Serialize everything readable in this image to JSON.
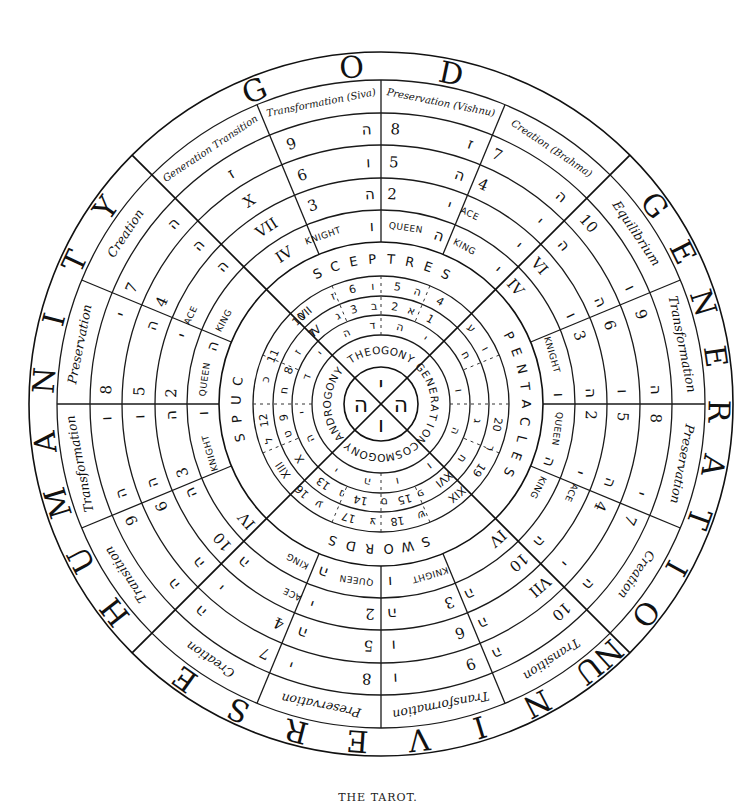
{
  "caption": "THE TAROT.",
  "geometry": {
    "cx": 381,
    "cy": 404,
    "rings": [
      352,
      324,
      291,
      259,
      226,
      194,
      162,
      128,
      108,
      89,
      69,
      37
    ],
    "heavy_rings": [
      352,
      162,
      37
    ]
  },
  "outer_words": [
    {
      "word": "GOD",
      "start": -22,
      "step": 17
    },
    {
      "word": "GENERATION",
      "start": 54,
      "step": 9.3
    },
    {
      "word": "UNIVERSE",
      "start": 142,
      "step": 10.5
    },
    {
      "word": "HUMANITY",
      "start": 232,
      "step": 10.5
    }
  ],
  "sector_labels": [
    {
      "text": "Generation Transition",
      "angle": -33.75,
      "cls": "t-label-sm"
    },
    {
      "text": "Transformation (Siva)",
      "angle": -11.25,
      "cls": "t-label-sm"
    },
    {
      "text": "Preservation (Vishnu)",
      "angle": 11.25,
      "cls": "t-label-sm"
    },
    {
      "text": "Creation (Brahma)",
      "angle": 33.75,
      "cls": "t-label-sm"
    },
    {
      "text": "Equilibrium",
      "angle": 56.25,
      "cls": "t-label"
    },
    {
      "text": "Transformation",
      "angle": 78.75,
      "cls": "t-label"
    },
    {
      "text": "Preservation",
      "angle": 101.25,
      "cls": "t-label"
    },
    {
      "text": "Creation",
      "angle": 123.75,
      "cls": "t-label"
    },
    {
      "text": "Transition",
      "angle": 146.25,
      "cls": "t-label"
    },
    {
      "text": "Transformation",
      "angle": 168.75,
      "cls": "t-label"
    },
    {
      "text": "Preservation",
      "angle": 191.25,
      "cls": "t-label"
    },
    {
      "text": "Creation",
      "angle": 213.75,
      "cls": "t-label"
    },
    {
      "text": "Transition",
      "angle": 236.25,
      "cls": "t-label"
    },
    {
      "text": "Transformation",
      "angle": 258.75,
      "cls": "t-label"
    },
    {
      "text": "Preservation",
      "angle": 281.25,
      "cls": "t-label"
    },
    {
      "text": "Creation",
      "angle": 303.75,
      "cls": "t-label"
    }
  ],
  "ring_cells": [
    {
      "r": 275,
      "items": [
        {
          "a": -33,
          "t": "ז",
          "c": "t-heb"
        },
        {
          "a": -19,
          "t": "9",
          "c": "t-num"
        },
        {
          "a": -3,
          "t": "ה",
          "c": "t-heb"
        },
        {
          "a": 3,
          "t": "8",
          "c": "t-num"
        },
        {
          "a": 19,
          "t": "ז",
          "c": "t-heb"
        },
        {
          "a": 25,
          "t": "7",
          "c": "t-num"
        },
        {
          "a": 41,
          "t": "ה",
          "c": "t-heb"
        },
        {
          "a": 49,
          "t": "10",
          "c": "t-num"
        },
        {
          "a": 65,
          "t": "ו",
          "c": "t-heb"
        },
        {
          "a": 71,
          "t": "9",
          "c": "t-num"
        },
        {
          "a": 87,
          "t": "ה",
          "c": "t-heb"
        },
        {
          "a": 93,
          "t": "8",
          "c": "t-num"
        },
        {
          "a": 109,
          "t": "י",
          "c": "t-heb"
        },
        {
          "a": 115,
          "t": "7",
          "c": "t-num"
        },
        {
          "a": 131,
          "t": "ה",
          "c": "t-heb"
        },
        {
          "a": 139,
          "t": "10",
          "c": "t-num"
        },
        {
          "a": 155,
          "t": "ה",
          "c": "t-heb"
        },
        {
          "a": 161,
          "t": "9",
          "c": "t-num"
        },
        {
          "a": 177,
          "t": "ו",
          "c": "t-heb"
        },
        {
          "a": 183,
          "t": "8",
          "c": "t-num"
        },
        {
          "a": 199,
          "t": "י",
          "c": "t-heb"
        },
        {
          "a": 205,
          "t": "7",
          "c": "t-num"
        },
        {
          "a": 221,
          "t": "ה",
          "c": "t-heb"
        },
        {
          "a": 229,
          "t": "ה",
          "c": "t-heb"
        },
        {
          "a": 245,
          "t": "9",
          "c": "t-num"
        },
        {
          "a": 251,
          "t": "ה",
          "c": "t-heb"
        },
        {
          "a": 267,
          "t": "ו",
          "c": "t-heb"
        },
        {
          "a": 273,
          "t": "8",
          "c": "t-num"
        },
        {
          "a": 289,
          "t": "י",
          "c": "t-heb"
        },
        {
          "a": 295,
          "t": "7",
          "c": "t-num"
        },
        {
          "a": 311,
          "t": "ה",
          "c": "t-heb"
        }
      ]
    },
    {
      "r": 242,
      "items": [
        {
          "a": -33,
          "t": "X",
          "c": "t-num"
        },
        {
          "a": -19,
          "t": "6",
          "c": "t-num"
        },
        {
          "a": -3,
          "t": "ו",
          "c": "t-heb"
        },
        {
          "a": 3,
          "t": "5",
          "c": "t-num"
        },
        {
          "a": 19,
          "t": "ה",
          "c": "t-heb"
        },
        {
          "a": 25,
          "t": "4",
          "c": "t-num"
        },
        {
          "a": 41,
          "t": "י",
          "c": "t-heb"
        },
        {
          "a": 49,
          "t": "ה",
          "c": "t-heb"
        },
        {
          "a": 65,
          "t": "ה",
          "c": "t-heb"
        },
        {
          "a": 71,
          "t": "6",
          "c": "t-num"
        },
        {
          "a": 87,
          "t": "ו",
          "c": "t-heb"
        },
        {
          "a": 93,
          "t": "5",
          "c": "t-num"
        },
        {
          "a": 109,
          "t": "ה",
          "c": "t-heb"
        },
        {
          "a": 115,
          "t": "4",
          "c": "t-num"
        },
        {
          "a": 131,
          "t": "י",
          "c": "t-heb"
        },
        {
          "a": 139,
          "t": "VII",
          "c": "t-num"
        },
        {
          "a": 155,
          "t": "ה",
          "c": "t-heb"
        },
        {
          "a": 161,
          "t": "6",
          "c": "t-num"
        },
        {
          "a": 177,
          "t": "ו",
          "c": "t-heb"
        },
        {
          "a": 183,
          "t": "5",
          "c": "t-num"
        },
        {
          "a": 199,
          "t": "ה",
          "c": "t-heb"
        },
        {
          "a": 205,
          "t": "4",
          "c": "t-num"
        },
        {
          "a": 221,
          "t": "י",
          "c": "t-heb"
        },
        {
          "a": 229,
          "t": "ה",
          "c": "t-heb"
        },
        {
          "a": 245,
          "t": "6",
          "c": "t-num"
        },
        {
          "a": 251,
          "t": "ה",
          "c": "t-heb"
        },
        {
          "a": 267,
          "t": "ו",
          "c": "t-heb"
        },
        {
          "a": 273,
          "t": "5",
          "c": "t-num"
        },
        {
          "a": 289,
          "t": "ה",
          "c": "t-heb"
        },
        {
          "a": 295,
          "t": "4",
          "c": "t-num"
        },
        {
          "a": 311,
          "t": "ה",
          "c": "t-heb"
        }
      ]
    },
    {
      "r": 210,
      "items": [
        {
          "a": -33,
          "t": "VII",
          "c": "t-num"
        },
        {
          "a": -19,
          "t": "3",
          "c": "t-num"
        },
        {
          "a": -3,
          "t": "ה",
          "c": "t-heb"
        },
        {
          "a": 3,
          "t": "2",
          "c": "t-num"
        },
        {
          "a": 19,
          "t": "י",
          "c": "t-heb"
        },
        {
          "a": 25,
          "t": "ACE",
          "c": "t-court"
        },
        {
          "a": 41,
          "t": "י",
          "c": "t-heb"
        },
        {
          "a": 49,
          "t": "VI",
          "c": "t-num"
        },
        {
          "a": 65,
          "t": "ו",
          "c": "t-heb"
        },
        {
          "a": 71,
          "t": "3",
          "c": "t-num"
        },
        {
          "a": 87,
          "t": "ה",
          "c": "t-heb"
        },
        {
          "a": 93,
          "t": "2",
          "c": "t-num"
        },
        {
          "a": 109,
          "t": "י",
          "c": "t-heb"
        },
        {
          "a": 115,
          "t": "ACE",
          "c": "t-court"
        },
        {
          "a": 131,
          "t": "ה",
          "c": "t-heb"
        },
        {
          "a": 139,
          "t": "10",
          "c": "t-num"
        },
        {
          "a": 155,
          "t": "ה",
          "c": "t-heb"
        },
        {
          "a": 161,
          "t": "3",
          "c": "t-num"
        },
        {
          "a": 177,
          "t": "ה",
          "c": "t-heb"
        },
        {
          "a": 183,
          "t": "2",
          "c": "t-num"
        },
        {
          "a": 199,
          "t": "י",
          "c": "t-heb"
        },
        {
          "a": 205,
          "t": "ACE",
          "c": "t-court"
        },
        {
          "a": 221,
          "t": "ה",
          "c": "t-heb"
        },
        {
          "a": 229,
          "t": "10",
          "c": "t-num"
        },
        {
          "a": 245,
          "t": "ה",
          "c": "t-heb"
        },
        {
          "a": 251,
          "t": "3",
          "c": "t-num"
        },
        {
          "a": 267,
          "t": "ה",
          "c": "t-heb"
        },
        {
          "a": 273,
          "t": "2",
          "c": "t-num"
        },
        {
          "a": 289,
          "t": "י",
          "c": "t-heb"
        },
        {
          "a": 295,
          "t": "ACE",
          "c": "t-court"
        },
        {
          "a": 311,
          "t": "ה",
          "c": "t-heb"
        }
      ]
    },
    {
      "r": 178,
      "items": [
        {
          "a": -33,
          "t": "IV",
          "c": "t-num"
        },
        {
          "a": -19,
          "t": "KNIGHT",
          "c": "t-court"
        },
        {
          "a": -3,
          "t": "ו",
          "c": "t-heb"
        },
        {
          "a": 8,
          "t": "QUEEN",
          "c": "t-court"
        },
        {
          "a": 19,
          "t": "ה",
          "c": "t-heb"
        },
        {
          "a": 28,
          "t": "KING",
          "c": "t-court"
        },
        {
          "a": 41,
          "t": "י",
          "c": "t-heb"
        },
        {
          "a": 49,
          "t": "IV",
          "c": "t-num"
        },
        {
          "a": 74,
          "t": "KNIGHT",
          "c": "t-court"
        },
        {
          "a": 87,
          "t": "ו",
          "c": "t-heb"
        },
        {
          "a": 98,
          "t": "QUEEN",
          "c": "t-court"
        },
        {
          "a": 109,
          "t": "ה",
          "c": "t-heb"
        },
        {
          "a": 118,
          "t": "KING",
          "c": "t-court"
        },
        {
          "a": 139,
          "t": "IV",
          "c": "t-num"
        },
        {
          "a": 164,
          "t": "KNIGHT",
          "c": "t-court"
        },
        {
          "a": 177,
          "t": "ו",
          "c": "t-heb"
        },
        {
          "a": 188,
          "t": "QUEEN",
          "c": "t-court"
        },
        {
          "a": 199,
          "t": "ה",
          "c": "t-heb"
        },
        {
          "a": 208,
          "t": "KING",
          "c": "t-court"
        },
        {
          "a": 229,
          "t": "IV",
          "c": "t-num"
        },
        {
          "a": 254,
          "t": "KNIGHT",
          "c": "t-court"
        },
        {
          "a": 267,
          "t": "ו",
          "c": "t-heb"
        },
        {
          "a": 278,
          "t": "QUEEN",
          "c": "t-court"
        },
        {
          "a": 289,
          "t": "ה",
          "c": "t-heb"
        },
        {
          "a": 298,
          "t": "KING",
          "c": "t-court"
        }
      ]
    }
  ],
  "suits": [
    {
      "word": "SCEPTRES",
      "start": -26,
      "step": 7.5
    },
    {
      "word": "PENTACLES",
      "start": 62,
      "step": 7
    },
    {
      "word": "SWORDS",
      "start": 162,
      "step": 7.5
    },
    {
      "word": "CUPS",
      "start": 279,
      "step": -7.5
    }
  ],
  "inner_rings": [
    {
      "r": 118,
      "items": [
        {
          "a": -40,
          "t": "VII"
        },
        {
          "a": -24,
          "t": "ז"
        },
        {
          "a": -14,
          "t": "6"
        },
        {
          "a": -4,
          "t": "ו"
        },
        {
          "a": 8,
          "t": "5"
        },
        {
          "a": 18,
          "t": "ה"
        },
        {
          "a": 30,
          "t": "4"
        },
        {
          "a": 50,
          "t": "ע"
        },
        {
          "a": 62,
          "t": "ו"
        },
        {
          "a": 100,
          "t": "20"
        },
        {
          "a": 112,
          "t": "ר"
        },
        {
          "a": 124,
          "t": "19"
        },
        {
          "a": 140,
          "t": "XIX"
        },
        {
          "a": 160,
          "t": "ש"
        },
        {
          "a": 172,
          "t": "18"
        },
        {
          "a": 184,
          "t": "צ"
        },
        {
          "a": 196,
          "t": "17"
        },
        {
          "a": 212,
          "t": "ע"
        },
        {
          "a": 222,
          "t": "16"
        },
        {
          "a": 236,
          "t": "XIII"
        },
        {
          "a": 252,
          "t": "ל"
        },
        {
          "a": 262,
          "t": "12"
        },
        {
          "a": 282,
          "t": "כ"
        },
        {
          "a": 294,
          "t": "11"
        },
        {
          "a": 316,
          "t": "10"
        }
      ]
    },
    {
      "r": 98,
      "items": [
        {
          "a": -42,
          "t": "IV"
        },
        {
          "a": -26,
          "t": "ג"
        },
        {
          "a": -16,
          "t": "3"
        },
        {
          "a": -4,
          "t": "ב"
        },
        {
          "a": 8,
          "t": "2"
        },
        {
          "a": 18,
          "t": "א"
        },
        {
          "a": 30,
          "t": "1"
        },
        {
          "a": 60,
          "t": "ח"
        },
        {
          "a": 100,
          "t": "ג"
        },
        {
          "a": 124,
          "t": "ח"
        },
        {
          "a": 140,
          "t": "XVI"
        },
        {
          "a": 156,
          "t": "פ"
        },
        {
          "a": 166,
          "t": "15"
        },
        {
          "a": 178,
          "t": "ס"
        },
        {
          "a": 192,
          "t": "14"
        },
        {
          "a": 204,
          "t": "נ"
        },
        {
          "a": 216,
          "t": "13"
        },
        {
          "a": 236,
          "t": "X"
        },
        {
          "a": 252,
          "t": "ט"
        },
        {
          "a": 262,
          "t": "9"
        },
        {
          "a": 278,
          "t": "ח"
        },
        {
          "a": 290,
          "t": "8"
        },
        {
          "a": 302,
          "t": "ז"
        },
        {
          "a": 316,
          "t": "7"
        }
      ]
    },
    {
      "r": 79,
      "items": [
        {
          "a": -26,
          "t": "ה"
        },
        {
          "a": -6,
          "t": "ד"
        },
        {
          "a": 14,
          "t": "ה"
        },
        {
          "a": 34,
          "t": "י"
        },
        {
          "a": 80,
          "t": "ו"
        },
        {
          "a": 110,
          "t": "ה"
        },
        {
          "a": 142,
          "t": "ו"
        },
        {
          "a": 168,
          "t": "ו"
        },
        {
          "a": 190,
          "t": "ה"
        },
        {
          "a": 214,
          "t": "י"
        },
        {
          "a": 244,
          "t": "ה"
        },
        {
          "a": 264,
          "t": "י"
        },
        {
          "a": 290,
          "t": "ד"
        },
        {
          "a": 310,
          "t": "י"
        }
      ]
    }
  ],
  "center_words": [
    {
      "word": "THEOGONY",
      "angle": 0
    },
    {
      "word": "GENERATION",
      "angle": 90
    },
    {
      "word": "COSMOGONY",
      "angle": 180
    },
    {
      "word": "ANDROGONY",
      "angle": 270
    }
  ],
  "center_letters": [
    {
      "t": "י",
      "a": 0
    },
    {
      "t": "ה",
      "a": 90
    },
    {
      "t": "ו",
      "a": 180
    },
    {
      "t": "ה",
      "a": 270
    }
  ]
}
